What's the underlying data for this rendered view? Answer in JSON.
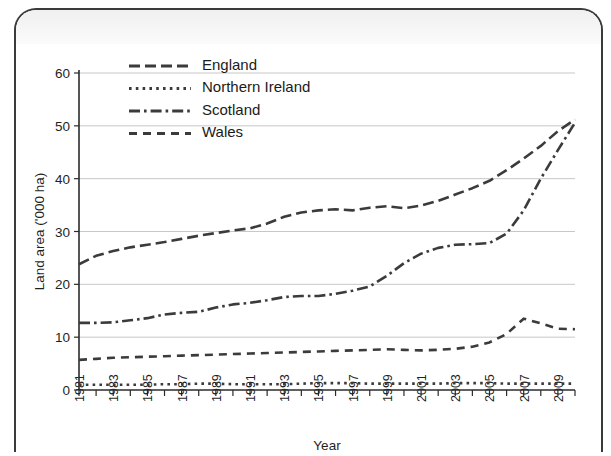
{
  "chart_data": {
    "type": "line",
    "title": "",
    "xlabel": "Year",
    "ylabel": "Land area ('000 ha)",
    "xlim": [
      1981,
      2010
    ],
    "ylim": [
      0,
      60
    ],
    "yticks": [
      0,
      10,
      20,
      30,
      40,
      50,
      60
    ],
    "xticks": [
      1981,
      1982,
      1983,
      1984,
      1985,
      1986,
      1987,
      1988,
      1989,
      1990,
      1991,
      1992,
      1993,
      1994,
      1995,
      1996,
      1997,
      1998,
      1999,
      2000,
      2001,
      2002,
      2003,
      2004,
      2005,
      2006,
      2007,
      2008,
      2009,
      2010
    ],
    "xtick_labels": [
      "1981",
      "",
      "1983",
      "",
      "1985",
      "",
      "1987",
      "",
      "1989",
      "",
      "1991",
      "",
      "1993",
      "",
      "1995",
      "",
      "1997",
      "",
      "1999",
      "",
      "2001",
      "",
      "2003",
      "",
      "2005",
      "",
      "2007",
      "",
      "2009",
      ""
    ],
    "grid": "horizontal",
    "legend_position": "top-center",
    "x": [
      1981,
      1982,
      1983,
      1984,
      1985,
      1986,
      1987,
      1988,
      1989,
      1990,
      1991,
      1992,
      1993,
      1994,
      1995,
      1996,
      1997,
      1998,
      1999,
      2000,
      2001,
      2002,
      2003,
      2004,
      2005,
      2006,
      2007,
      2008,
      2009,
      2010
    ],
    "series": [
      {
        "name": "England",
        "line_style": "long-dash",
        "values": [
          23.8,
          25.4,
          26.3,
          27.0,
          27.5,
          28.0,
          28.6,
          29.2,
          29.7,
          30.2,
          30.6,
          31.5,
          32.8,
          33.6,
          34.0,
          34.2,
          34.0,
          34.5,
          34.8,
          34.4,
          34.9,
          35.8,
          37.0,
          38.2,
          39.6,
          41.6,
          43.8,
          46.2,
          49.0,
          51.2
        ]
      },
      {
        "name": "Northern Ireland",
        "line_style": "dotted",
        "values": [
          1.0,
          1.0,
          1.0,
          1.0,
          1.0,
          1.1,
          1.1,
          1.2,
          1.2,
          1.1,
          1.1,
          1.1,
          1.1,
          1.2,
          1.3,
          1.3,
          1.3,
          1.2,
          1.2,
          1.2,
          1.2,
          1.2,
          1.3,
          1.3,
          1.3,
          1.2,
          1.2,
          1.2,
          1.2,
          1.2
        ]
      },
      {
        "name": "Scotland",
        "line_style": "dash-dot",
        "values": [
          12.7,
          12.7,
          12.8,
          13.2,
          13.6,
          14.3,
          14.6,
          14.8,
          15.6,
          16.2,
          16.5,
          17.0,
          17.6,
          17.8,
          17.8,
          18.2,
          18.8,
          19.6,
          21.6,
          24.0,
          25.8,
          26.9,
          27.5,
          27.6,
          27.8,
          29.6,
          34.0,
          40.0,
          45.4,
          50.6
        ]
      },
      {
        "name": "Wales",
        "line_style": "dashed",
        "values": [
          5.7,
          5.9,
          6.1,
          6.2,
          6.3,
          6.4,
          6.5,
          6.6,
          6.7,
          6.8,
          6.9,
          7.0,
          7.1,
          7.2,
          7.3,
          7.4,
          7.5,
          7.6,
          7.7,
          7.6,
          7.5,
          7.6,
          7.8,
          8.2,
          9.0,
          10.6,
          13.5,
          12.6,
          11.6,
          11.5
        ]
      }
    ],
    "legend": [
      {
        "label": "England",
        "style": "long-dash"
      },
      {
        "label": "Northern Ireland",
        "style": "dotted"
      },
      {
        "label": "Scotland",
        "style": "dash-dot"
      },
      {
        "label": "Wales",
        "style": "dashed"
      }
    ]
  }
}
